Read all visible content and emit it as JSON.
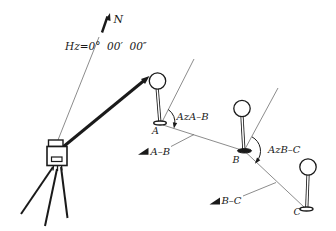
{
  "colors": {
    "ink": "#1a1a1a",
    "faint_line": "#6e6e6e",
    "background": "#ffffff"
  },
  "labels": {
    "north": "N",
    "hz_reading": "Hz=0°  00′  00″",
    "station_a": "A",
    "station_b": "B",
    "station_c": "C",
    "azimuth_ab": "AzA–B",
    "azimuth_bc": "AzB–C",
    "direction_ab": "A–B",
    "direction_bc": "B–C"
  },
  "icons": {
    "north_arrow_icon": "thick-arrow-up-right",
    "sight_arrow_icon": "thick-arrow-to-prism",
    "direction_tag_icon": "filled-right-triangle",
    "azimuth_arc_icon": "clockwise-arc-arrow"
  }
}
